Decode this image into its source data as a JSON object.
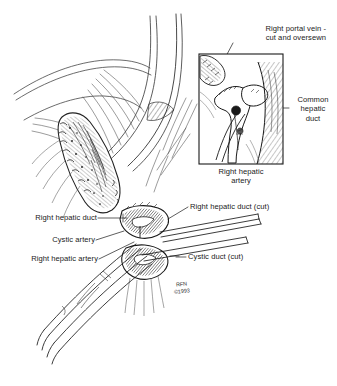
{
  "figure": {
    "title_present": false,
    "background_color": "#ffffff",
    "ink_color": "#1a1a1a"
  },
  "labels": {
    "portal_vein": {
      "line1": "Right portal vein -",
      "line2": "cut and oversewn"
    },
    "common_hepatic_duct": {
      "line1": "Common",
      "line2": "hepatic",
      "line3": "duct"
    },
    "right_hepatic_artery_inset": {
      "line1": "Right hepatic",
      "line2": "artery"
    },
    "right_hepatic_duct": "Right hepatic duct",
    "cystic_artery": "Cystic artery",
    "right_hepatic_artery": "Right hepatic artery",
    "right_hepatic_duct_cut": "Right hepatic duct (cut)",
    "cystic_duct_cut": "Cystic duct (cut)"
  },
  "signature": {
    "initials": "RFN",
    "copyright": "©1993"
  },
  "inset": {
    "frame": {
      "x": 199,
      "y": 54,
      "width": 84,
      "height": 110
    },
    "border_color": "#1a1a1a"
  }
}
